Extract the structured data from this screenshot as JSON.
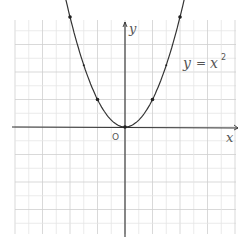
{
  "chart_data": {
    "type": "line",
    "title": "",
    "equation_label": "y = x²",
    "equation_parts": {
      "lhs": "y",
      "eq": "=",
      "rhs": "x",
      "exp": "2"
    },
    "xlabel": "x",
    "ylabel": "y",
    "origin_label": "O",
    "xlim": [
      -4,
      4
    ],
    "ylim": [
      -4,
      4
    ],
    "grid": true,
    "series": [
      {
        "name": "y = x^2",
        "x": [
          -2,
          -1.5,
          -1,
          -0.5,
          0,
          0.5,
          1,
          1.5,
          2
        ],
        "y": [
          4,
          2.25,
          1,
          0.25,
          0,
          0.25,
          1,
          2.25,
          4
        ]
      }
    ],
    "marked_points": [
      [
        -2,
        4
      ],
      [
        -1.5,
        2.25
      ],
      [
        -1,
        1
      ],
      [
        0,
        0
      ],
      [
        1,
        1
      ],
      [
        1.5,
        2.25
      ],
      [
        2,
        4
      ]
    ]
  },
  "colors": {
    "curve": "#333333",
    "grid_major": "#cfcfcf",
    "grid_minor": "#e6e6e6",
    "axis": "#333333"
  }
}
